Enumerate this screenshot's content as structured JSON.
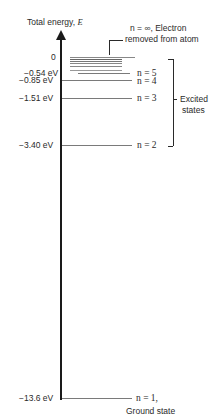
{
  "diagram": {
    "type": "energy-level-diagram",
    "axis_label_prefix": "Total energy,",
    "axis_label_var": "E",
    "top_annotation_line1": "n = ∞, Electron",
    "top_annotation_line2": "removed from atom",
    "levels": [
      {
        "energy_label": "0",
        "n_label": "",
        "energy_ev": 0
      },
      {
        "energy_label": "−0.54 eV",
        "n_label": "n = 5",
        "energy_ev": -0.54
      },
      {
        "energy_label": "−0.85 eV",
        "n_label": "n = 4",
        "energy_ev": -0.85
      },
      {
        "energy_label": "−1.51 eV",
        "n_label": "n = 3",
        "energy_ev": -1.51
      },
      {
        "energy_label": "−3.40 eV",
        "n_label": "n = 2",
        "energy_ev": -3.4
      },
      {
        "energy_label": "−13.6 eV",
        "n_label": "n = 1,",
        "energy_ev": -13.6
      }
    ],
    "ground_state_label": "Ground state",
    "excited_label_line1": "Excited",
    "excited_label_line2": "states"
  }
}
